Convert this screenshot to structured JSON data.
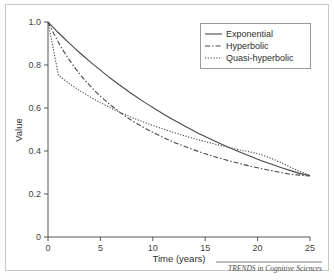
{
  "figure": {
    "footer_credit": "TRENDS in Cognitive Sciences"
  },
  "chart_data": {
    "type": "line",
    "title": "",
    "xlabel": "Time (years)",
    "ylabel": "Value",
    "xlim": [
      0,
      25
    ],
    "ylim": [
      0,
      1.0
    ],
    "xticks": [
      "0",
      "5",
      "10",
      "15",
      "20",
      "25"
    ],
    "xtick_values": [
      0,
      5,
      10,
      15,
      20,
      25
    ],
    "yticks": [
      "0",
      "0.2",
      "0.4",
      "0.6",
      "0.8",
      "1.0"
    ],
    "ytick_values": [
      0,
      0.2,
      0.4,
      0.6,
      0.8,
      1.0
    ],
    "grid": false,
    "legend_position": "top-right",
    "line_color": "#4a4a4a",
    "x": [
      0,
      1,
      2,
      3,
      4,
      5,
      6,
      7,
      8,
      9,
      10,
      11,
      12,
      13,
      14,
      15,
      16,
      17,
      18,
      19,
      20,
      21,
      22,
      23,
      24,
      25
    ],
    "series": [
      {
        "name": "Exponential",
        "style": "solid",
        "values": [
          1.0,
          0.95,
          0.903,
          0.858,
          0.816,
          0.776,
          0.737,
          0.701,
          0.666,
          0.633,
          0.602,
          0.572,
          0.544,
          0.517,
          0.491,
          0.467,
          0.444,
          0.422,
          0.401,
          0.381,
          0.362,
          0.344,
          0.327,
          0.311,
          0.296,
          0.285
        ]
      },
      {
        "name": "Hyperbolic",
        "style": "dash-dot",
        "values": [
          1.0,
          0.905,
          0.826,
          0.76,
          0.704,
          0.655,
          0.613,
          0.575,
          0.542,
          0.513,
          0.487,
          0.463,
          0.441,
          0.422,
          0.404,
          0.387,
          0.372,
          0.358,
          0.345,
          0.333,
          0.322,
          0.312,
          0.302,
          0.293,
          0.288,
          0.284
        ]
      },
      {
        "name": "Quasi-hyperbolic",
        "style": "dotted",
        "values": [
          1.0,
          0.752,
          0.715,
          0.682,
          0.652,
          0.625,
          0.6,
          0.577,
          0.556,
          0.537,
          0.519,
          0.502,
          0.486,
          0.471,
          0.457,
          0.444,
          0.431,
          0.42,
          0.408,
          0.398,
          0.388,
          0.371,
          0.351,
          0.328,
          0.305,
          0.287
        ]
      }
    ]
  },
  "legend": {
    "items": [
      {
        "label": "Exponential"
      },
      {
        "label": "Hyperbolic"
      },
      {
        "label": "Quasi-hyperbolic"
      }
    ]
  }
}
